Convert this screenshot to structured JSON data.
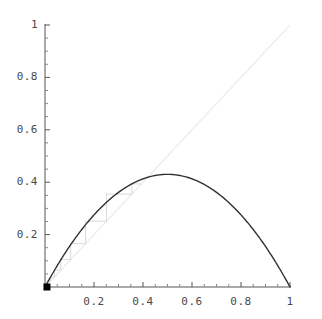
{
  "figure": {
    "background_color": "#ffffff",
    "axis_color": "#555555",
    "curve_color": "#303030",
    "diagonal_color": "#ededed",
    "cobweb_color": "#d8d8d8",
    "point_color": "#000000",
    "label_color": "#4a4a4a"
  },
  "chart_data": {
    "type": "line",
    "title": "",
    "subtitle": "",
    "xlabel": "",
    "ylabel": "",
    "xlim": [
      0,
      1
    ],
    "ylim": [
      0,
      1
    ],
    "grid": false,
    "legend": null,
    "x_ticks": [
      0.2,
      0.4,
      0.6,
      0.8,
      1
    ],
    "x_tick_labels": [
      "0.2",
      "0.4",
      "0.6",
      "0.8",
      "1"
    ],
    "y_ticks": [
      0.2,
      0.4,
      0.6,
      0.8,
      1
    ],
    "y_tick_labels": [
      "0.2",
      "0.4",
      "0.6",
      "0.8",
      "1"
    ],
    "x_minor_ticks": [
      0.05,
      0.1,
      0.15,
      0.25,
      0.3,
      0.35,
      0.45,
      0.5,
      0.55,
      0.65,
      0.7,
      0.75,
      0.85,
      0.9,
      0.95
    ],
    "y_minor_ticks": [
      0.05,
      0.1,
      0.15,
      0.25,
      0.3,
      0.35,
      0.45,
      0.5,
      0.55,
      0.65,
      0.7,
      0.75,
      0.85,
      0.9,
      0.95
    ],
    "series": [
      {
        "name": "logistic-map",
        "kind": "curve",
        "formula": "f(x) = r*x*(1-x)",
        "r": 1.72,
        "peak": {
          "x": 0.5,
          "y": 0.43
        },
        "x": [
          0,
          0.05,
          0.1,
          0.15,
          0.2,
          0.25,
          0.3,
          0.35,
          0.4,
          0.45,
          0.5,
          0.55,
          0.6,
          0.65,
          0.7,
          0.75,
          0.8,
          0.85,
          0.9,
          0.95,
          1
        ],
        "values": [
          0,
          0.0817,
          0.1548,
          0.2193,
          0.2752,
          0.3225,
          0.3612,
          0.3913,
          0.4128,
          0.4257,
          0.43,
          0.4257,
          0.4128,
          0.3913,
          0.3612,
          0.3225,
          0.2752,
          0.2193,
          0.1548,
          0.0817,
          0
        ]
      },
      {
        "name": "identity-line",
        "kind": "diagonal",
        "formula": "y = x",
        "x": [
          0,
          1
        ],
        "values": [
          0,
          1
        ]
      },
      {
        "name": "cobweb-orbit",
        "kind": "staircase",
        "x0": 0.008,
        "iterations": 8,
        "x": [
          0.008,
          0.0137,
          0.0232,
          0.039,
          0.0645,
          0.1047,
          0.1655,
          0.2511,
          0.3546
        ],
        "values": [
          0.0137,
          0.0232,
          0.039,
          0.0645,
          0.1047,
          0.1655,
          0.2511,
          0.3546,
          0.3934
        ]
      }
    ],
    "markers": [
      {
        "name": "initial-point",
        "x": 0.008,
        "y": 0.0,
        "shape": "square",
        "size": 7,
        "color": "#000000"
      }
    ]
  },
  "axes": {
    "y_labels": [
      {
        "text": "1",
        "value": 1.0
      },
      {
        "text": "0.8",
        "value": 0.8
      },
      {
        "text": "0.6",
        "value": 0.6
      },
      {
        "text": "0.4",
        "value": 0.4
      },
      {
        "text": "0.2",
        "value": 0.2
      }
    ],
    "x_labels": [
      {
        "text": "0.2",
        "value": 0.2
      },
      {
        "text": "0.4",
        "value": 0.4
      },
      {
        "text": "0.6",
        "value": 0.6
      },
      {
        "text": "0.8",
        "value": 0.8
      },
      {
        "text": "1",
        "value": 1.0
      }
    ]
  }
}
